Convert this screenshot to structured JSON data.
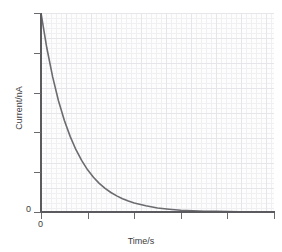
{
  "chart_data": {
    "type": "line",
    "title": "",
    "xlabel": "Time/s",
    "ylabel": "Current/nA",
    "xlim": [
      0,
      10
    ],
    "ylim": [
      0,
      100
    ],
    "grid": true,
    "legend": false,
    "x_tick_labels": [
      "0"
    ],
    "y_tick_labels": [
      "0"
    ],
    "x_tick_positions": [
      0,
      2,
      4,
      6,
      8,
      10
    ],
    "y_tick_positions": [
      0,
      20,
      40,
      60,
      80,
      100
    ],
    "series": [
      {
        "name": "Current decay",
        "color": "#6b6b70",
        "x": [
          0.0,
          0.25,
          0.5,
          0.75,
          1.0,
          1.25,
          1.5,
          1.75,
          2.0,
          2.25,
          2.5,
          2.75,
          3.0,
          3.25,
          3.5,
          3.75,
          4.0,
          4.5,
          5.0,
          5.5,
          6.0,
          6.5,
          7.0,
          7.5,
          8.0,
          8.5,
          9.0,
          9.5,
          10.0
        ],
        "y": [
          100.0,
          82.4,
          67.9,
          55.9,
          46.1,
          38.0,
          31.3,
          25.8,
          21.2,
          17.5,
          14.4,
          11.9,
          9.8,
          8.1,
          6.7,
          5.5,
          4.5,
          3.1,
          2.0,
          1.4,
          0.9,
          0.6,
          0.4,
          0.3,
          0.2,
          0.12,
          0.08,
          0.05,
          0.03
        ]
      }
    ]
  },
  "axes": {
    "origin_label_x": "0",
    "origin_label_y": "0",
    "x_title": "Time/s",
    "y_title": "Current/nA"
  },
  "colors": {
    "curve": "#6b6b70",
    "axis": "#5b5b5f",
    "grid_minor": "#f0f0f2",
    "grid_major": "#e6e6ea",
    "background": "#ffffff",
    "plot_background": "#fdfdfd",
    "text": "#3c3c40"
  }
}
